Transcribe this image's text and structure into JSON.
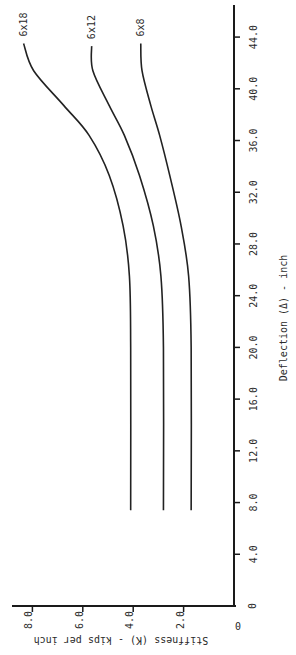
{
  "chart_data": {
    "type": "line",
    "orientation": "rotated 90deg (page printed sideways)",
    "title": "",
    "xlabel": "Deflection (Δ) - inch",
    "ylabel": "Stiffness (K) - kips per inch",
    "x_ticks": [
      "0",
      "4.0",
      "8.0",
      "12.0",
      "16.0",
      "20.0",
      "24.0",
      "28.0",
      "32.0",
      "36.0",
      "40.0",
      "44.0"
    ],
    "y_ticks": [
      "0",
      "2.0",
      "4.0",
      "6.0",
      "8.0"
    ],
    "xlim": [
      0,
      46
    ],
    "ylim": [
      0,
      8.8
    ],
    "grid": false,
    "legend": "inline labels at curve ends",
    "series": [
      {
        "name": "6x18",
        "points": [
          [
            7.4,
            4.1
          ],
          [
            20,
            4.1
          ],
          [
            25.5,
            4.15
          ],
          [
            29.4,
            4.4
          ],
          [
            33.3,
            4.95
          ],
          [
            36.4,
            5.75
          ],
          [
            38.7,
            6.75
          ],
          [
            41.4,
            7.95
          ],
          [
            43.5,
            8.35
          ]
        ]
      },
      {
        "name": "6x12",
        "points": [
          [
            7.4,
            2.8
          ],
          [
            20,
            2.8
          ],
          [
            25.5,
            2.9
          ],
          [
            29.4,
            3.2
          ],
          [
            33.3,
            3.75
          ],
          [
            36.4,
            4.35
          ],
          [
            38.7,
            4.95
          ],
          [
            41.4,
            5.6
          ],
          [
            43.3,
            5.65
          ]
        ]
      },
      {
        "name": "6x8",
        "points": [
          [
            7.4,
            1.7
          ],
          [
            20,
            1.7
          ],
          [
            25.5,
            1.8
          ],
          [
            29.4,
            2.1
          ],
          [
            33.3,
            2.55
          ],
          [
            36.4,
            2.95
          ],
          [
            38.7,
            3.3
          ],
          [
            41.4,
            3.65
          ],
          [
            43.5,
            3.7
          ]
        ]
      }
    ]
  },
  "axis": {
    "x_title": "Deflection (Δ) - inch",
    "y_title": "Stiffness (K) - kips per inch",
    "x_ticks": [
      "0",
      "4.0",
      "8.0",
      "12.0",
      "16.0",
      "20.0",
      "24.0",
      "28.0",
      "32.0",
      "36.0",
      "40.0",
      "44.0"
    ],
    "y_ticks": [
      "0",
      "2.0",
      "4.0",
      "6.0",
      "8.0"
    ]
  },
  "series_labels": [
    "6x18",
    "6x12",
    "6x8"
  ]
}
